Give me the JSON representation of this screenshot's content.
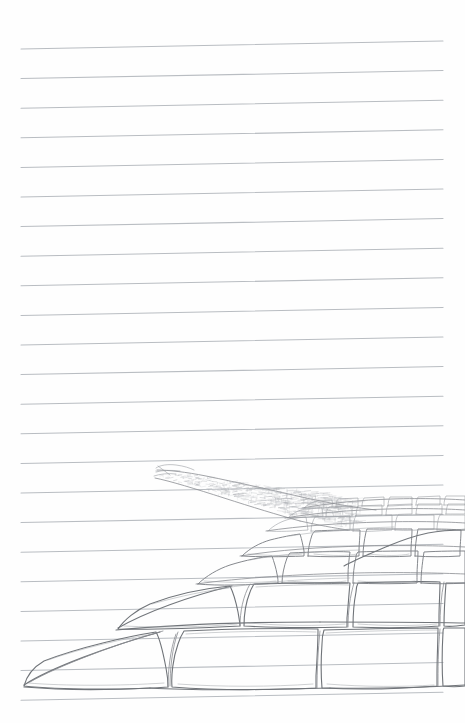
{
  "page": {
    "kind": "lined-notebook-paper",
    "width": 465,
    "height": 723,
    "background_color": "#fefefe"
  },
  "ruling": {
    "line_color": "#b9bdc2",
    "line_count": 23,
    "left_x": 21,
    "right_x": 443,
    "first_line_y_left": 49,
    "spacing": 29.6,
    "tilt_rise_px": 8,
    "stroke_width": 1.05
  },
  "drawing": {
    "name": "cobblestone-path-perspective-sketch",
    "medium": "graphite pencil",
    "subject": "receding cobblestone / flagstone path",
    "pencil_color_foreground": "#6f7378",
    "pencil_color_midground": "#7e8287",
    "pencil_color_far": "#9a9da2",
    "vanishing_point": {
      "x": 157,
      "y": 470
    },
    "path_extent": {
      "far_tip_x": 155,
      "far_tip_y": 468,
      "near_left_x": 24,
      "near_right_x": 465,
      "near_y": 690
    },
    "bands": [
      {
        "name": "band-far-speckle",
        "y_top": 462,
        "y_bottom": 500,
        "stone_scale": "tiny",
        "note": "hatched speckled dots suggesting distant cobbles"
      },
      {
        "name": "band-far",
        "y_top": 500,
        "y_bottom": 535,
        "stone_scale": "small"
      },
      {
        "name": "band-mid-far",
        "y_top": 535,
        "y_bottom": 562,
        "stone_scale": "medium-small"
      },
      {
        "name": "band-mid",
        "y_top": 562,
        "y_bottom": 590,
        "stone_scale": "medium"
      },
      {
        "name": "band-near",
        "y_top": 590,
        "y_bottom": 632,
        "stone_scale": "large"
      },
      {
        "name": "band-foreground",
        "y_top": 632,
        "y_bottom": 692,
        "stone_scale": "very-large"
      }
    ]
  }
}
